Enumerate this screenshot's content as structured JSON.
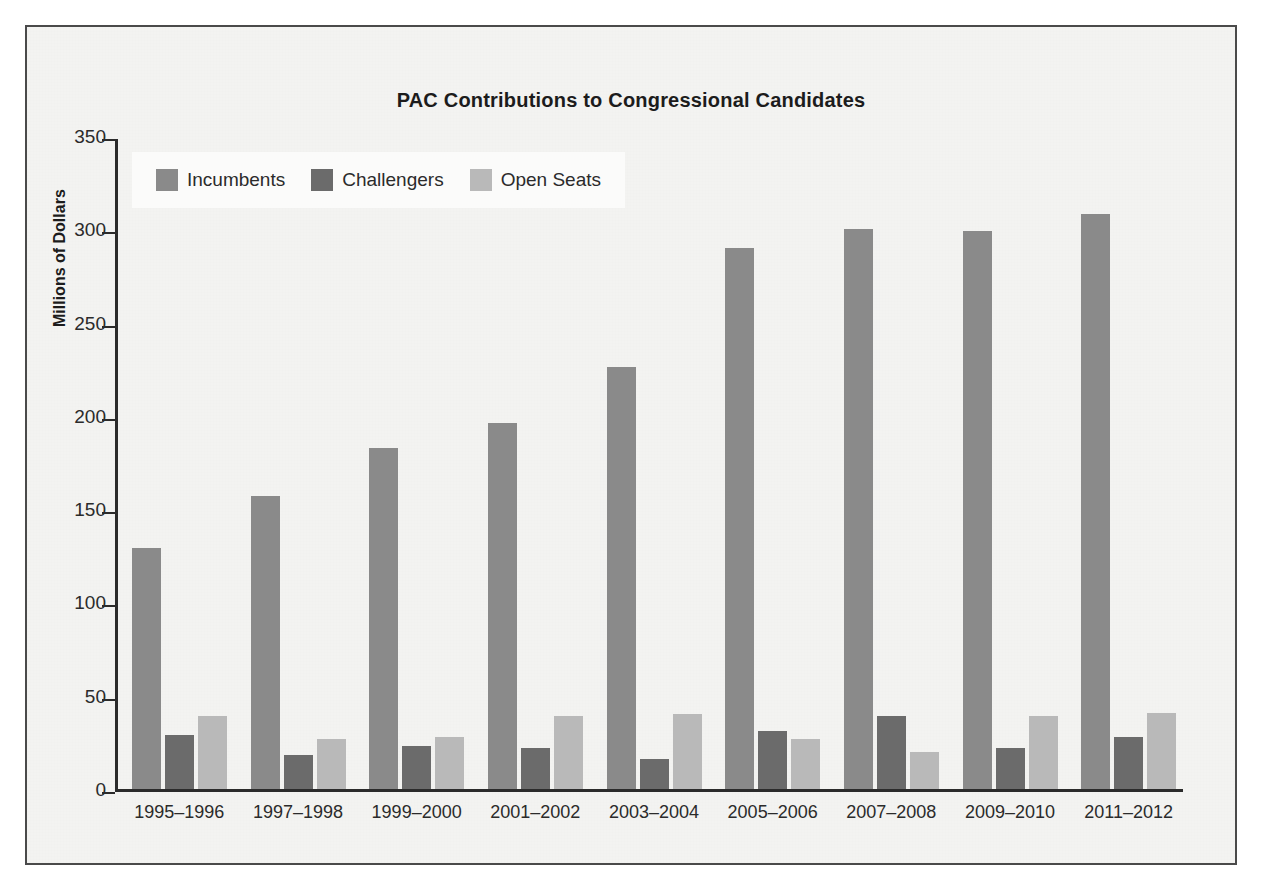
{
  "chart_data": {
    "type": "bar",
    "title": "PAC Contributions to Congressional Candidates",
    "xlabel": "",
    "ylabel": "Millions of Dollars",
    "ylim": [
      0,
      350
    ],
    "yticks": [
      0,
      50,
      100,
      150,
      200,
      250,
      300,
      350
    ],
    "grid": false,
    "legend_position": "top-left",
    "categories": [
      "1995–1996",
      "1997–1998",
      "1999–2000",
      "2001–2002",
      "2003–2004",
      "2005–2006",
      "2007–2008",
      "2009–2010",
      "2011–2012"
    ],
    "series": [
      {
        "name": "Incumbents",
        "color": "#8a8a8a",
        "values": [
          129,
          157,
          183,
          196,
          226,
          290,
          300,
          299,
          308
        ]
      },
      {
        "name": "Challengers",
        "color": "#6b6b6b",
        "values": [
          29,
          18,
          23,
          22,
          16,
          31,
          39,
          22,
          28
        ]
      },
      {
        "name": "Open Seats",
        "color": "#b9b9b9",
        "values": [
          39,
          27,
          28,
          39,
          40,
          27,
          20,
          39,
          41
        ]
      }
    ]
  },
  "colors": {
    "background": "#f3f3f1",
    "frame_border": "#4a4a4a",
    "axis": "#2b2b2b",
    "text": "#1c1c1c",
    "legend_background": "#fbfbfa"
  }
}
